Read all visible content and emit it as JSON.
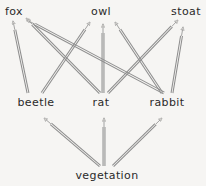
{
  "diagram": {
    "background_color": "#f6f5f3",
    "arrow_color": "#8d8d8d",
    "arrow_fill": "#d6d4d1",
    "text_color": "#2a2a2a",
    "nodes": [
      {
        "id": "fox",
        "label": "fox",
        "x": 14,
        "y": 12,
        "trophic_level": "predator"
      },
      {
        "id": "owl",
        "label": "owl",
        "x": 101,
        "y": 12,
        "trophic_level": "predator"
      },
      {
        "id": "stoat",
        "label": "stoat",
        "x": 186,
        "y": 12,
        "trophic_level": "predator"
      },
      {
        "id": "beetle",
        "label": "beetle",
        "x": 36,
        "y": 103,
        "trophic_level": "primary consumer"
      },
      {
        "id": "rat",
        "label": "rat",
        "x": 101,
        "y": 103,
        "trophic_level": "primary consumer"
      },
      {
        "id": "rabbit",
        "label": "rabbit",
        "x": 167,
        "y": 103,
        "trophic_level": "primary consumer"
      },
      {
        "id": "vegetation",
        "label": "vegetation",
        "x": 107,
        "y": 176,
        "trophic_level": "producer"
      }
    ],
    "edges": [
      {
        "from": "vegetation",
        "to": "beetle",
        "x1": 100,
        "y1": 166,
        "x2": 44,
        "y2": 118
      },
      {
        "from": "vegetation",
        "to": "rat",
        "x1": 104,
        "y1": 166,
        "x2": 104,
        "y2": 118
      },
      {
        "from": "vegetation",
        "to": "rabbit",
        "x1": 113,
        "y1": 166,
        "x2": 162,
        "y2": 118
      },
      {
        "from": "beetle",
        "to": "fox",
        "x1": 28,
        "y1": 93,
        "x2": 13,
        "y2": 21
      },
      {
        "from": "beetle",
        "to": "owl",
        "x1": 42,
        "y1": 93,
        "x2": 90,
        "y2": 22
      },
      {
        "from": "rat",
        "to": "fox",
        "x1": 100,
        "y1": 93,
        "x2": 26,
        "y2": 18
      },
      {
        "from": "rat",
        "to": "owl",
        "x1": 103,
        "y1": 93,
        "x2": 103,
        "y2": 24
      },
      {
        "from": "rat",
        "to": "stoat",
        "x1": 108,
        "y1": 93,
        "x2": 178,
        "y2": 20
      },
      {
        "from": "rabbit",
        "to": "fox",
        "x1": 164,
        "y1": 93,
        "x2": 27,
        "y2": 20
      },
      {
        "from": "rabbit",
        "to": "owl",
        "x1": 162,
        "y1": 93,
        "x2": 115,
        "y2": 22
      },
      {
        "from": "rabbit",
        "to": "stoat",
        "x1": 172,
        "y1": 93,
        "x2": 183,
        "y2": 27
      }
    ]
  }
}
